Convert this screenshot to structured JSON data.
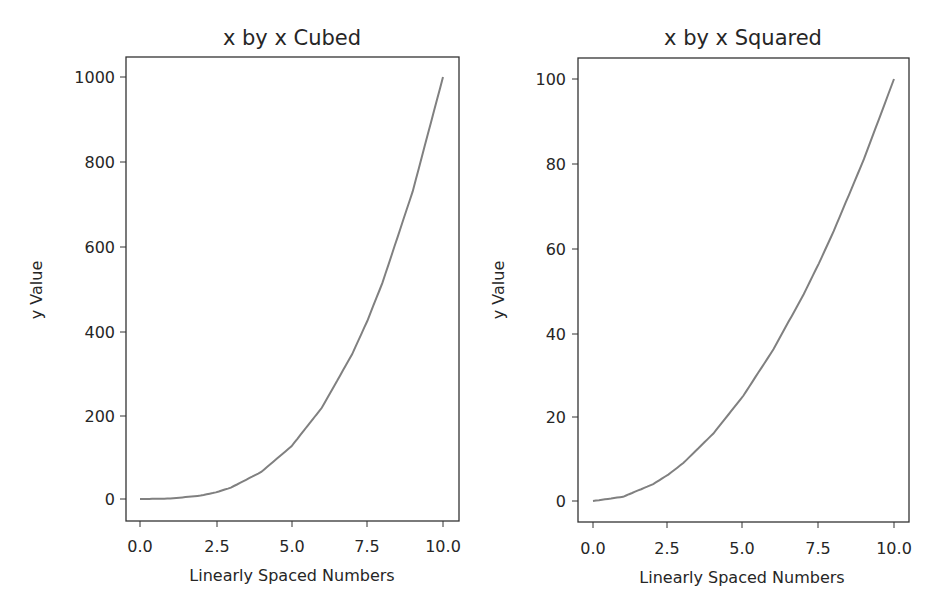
{
  "chart_data": [
    {
      "type": "line",
      "title": "x by x Cubed",
      "xlabel": "Linearly Spaced Numbers",
      "ylabel": "y Value",
      "xlim": [
        -0.5,
        10.5
      ],
      "ylim": [
        -50,
        1050
      ],
      "xticks": [
        "0.0",
        "2.5",
        "5.0",
        "7.5",
        "10.0"
      ],
      "yticks": [
        "0",
        "200",
        "400",
        "600",
        "800",
        "1000"
      ],
      "grid": false,
      "series": [
        {
          "name": "x^3",
          "color": "#808080",
          "x": [
            0,
            1,
            2,
            2.5,
            3,
            4,
            5,
            6,
            7,
            7.5,
            8,
            9,
            10
          ],
          "y": [
            0,
            1,
            8,
            15.6,
            27,
            64,
            125,
            216,
            343,
            421.9,
            512,
            729,
            1000
          ]
        }
      ]
    },
    {
      "type": "line",
      "title": "x by x Squared",
      "xlabel": "Linearly Spaced Numbers",
      "ylabel": "y Value",
      "xlim": [
        -0.5,
        10.5
      ],
      "ylim": [
        -5,
        105
      ],
      "xticks": [
        "0.0",
        "2.5",
        "5.0",
        "7.5",
        "10.0"
      ],
      "yticks": [
        "0",
        "20",
        "40",
        "60",
        "80",
        "100"
      ],
      "grid": false,
      "series": [
        {
          "name": "x^2",
          "color": "#808080",
          "x": [
            0,
            1,
            2,
            2.5,
            3,
            4,
            5,
            6,
            7,
            7.5,
            8,
            9,
            10
          ],
          "y": [
            0,
            1,
            4,
            6.25,
            9,
            16,
            25,
            36,
            49,
            56.25,
            64,
            81,
            100
          ]
        }
      ]
    }
  ]
}
